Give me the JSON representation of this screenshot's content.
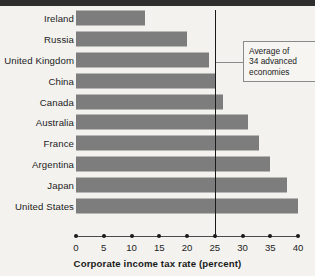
{
  "chart_data": {
    "type": "bar",
    "orientation": "horizontal",
    "title": "",
    "xlabel": "Corporate income tax rate (percent)",
    "ylabel": "",
    "xlim": [
      0,
      40
    ],
    "xticks": [
      0,
      5,
      10,
      15,
      20,
      25,
      30,
      35,
      40
    ],
    "xtick_labels": [
      "0",
      "5",
      "10",
      "15",
      "20",
      "25",
      "30",
      "35",
      "40"
    ],
    "grid": false,
    "legend": null,
    "categories": [
      "Ireland",
      "Russia",
      "United Kingdom",
      "China",
      "Canada",
      "Australia",
      "France",
      "Argentina",
      "Japan",
      "United States"
    ],
    "values": [
      12.5,
      20,
      24,
      25,
      26.5,
      31,
      33,
      35,
      38,
      40
    ],
    "bar_color": "#7d7d7d",
    "annotations": [
      {
        "name": "average-line",
        "text": "Average of 34 advanced economies",
        "lines": [
          "Average of",
          "34 advanced",
          "economies"
        ],
        "value": 25,
        "line_color": "#1a1a1a"
      }
    ]
  },
  "axis": {
    "title": "Corporate income tax rate (percent)"
  },
  "callout": {
    "line1": "Average of",
    "line2": "34 advanced",
    "line3": "economies"
  }
}
